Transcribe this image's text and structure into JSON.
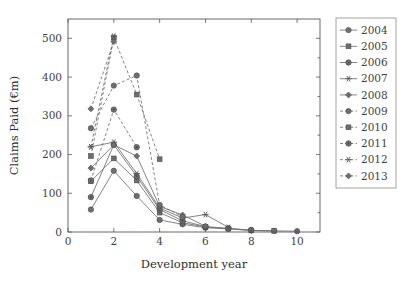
{
  "chart_data": {
    "type": "line",
    "title": "",
    "xlabel": "Development year",
    "ylabel": "Claims Paid (€m)",
    "xlim": [
      0,
      11
    ],
    "ylim": [
      0,
      550
    ],
    "xticks": [
      0,
      2,
      4,
      6,
      8,
      10
    ],
    "yticks": [
      0,
      100,
      200,
      300,
      400,
      500
    ],
    "xticklabels": [
      "0",
      "2",
      "4",
      "6",
      "8",
      "10"
    ],
    "yticklabels": [
      "0",
      "100",
      "200",
      "300",
      "400",
      "500"
    ],
    "grid": false,
    "legend_position": "right-outside",
    "x": [
      1,
      2,
      3,
      4,
      5,
      6,
      7,
      8,
      9,
      10
    ],
    "series": [
      {
        "name": "2004",
        "marker": "circle",
        "dash": "solid",
        "color": "#6e6e6e",
        "x": [
          1,
          2,
          3,
          4,
          5,
          6,
          7,
          8,
          9,
          10
        ],
        "values": [
          58,
          158,
          93,
          31,
          20,
          11,
          8,
          4,
          3,
          2
        ]
      },
      {
        "name": "2005",
        "marker": "square",
        "dash": "solid",
        "color": "#6e6e6e",
        "x": [
          1,
          2,
          3,
          4,
          5,
          6,
          7,
          8,
          9
        ],
        "values": [
          131,
          190,
          133,
          50,
          24,
          13,
          9,
          4,
          3
        ]
      },
      {
        "name": "2006",
        "marker": "circle-filled",
        "dash": "solid",
        "color": "#6e6e6e",
        "x": [
          1,
          2,
          3,
          4,
          5,
          6,
          7,
          8
        ],
        "values": [
          90,
          225,
          144,
          58,
          29,
          14,
          9,
          5
        ]
      },
      {
        "name": "2007",
        "marker": "star",
        "dash": "solid",
        "color": "#6e6e6e",
        "x": [
          1,
          2,
          3,
          4,
          5,
          6,
          7
        ],
        "values": [
          220,
          232,
          151,
          62,
          36,
          45,
          12
        ]
      },
      {
        "name": "2008",
        "marker": "diamond",
        "dash": "solid",
        "color": "#6e6e6e",
        "x": [
          1,
          2,
          3,
          4,
          5,
          6
        ],
        "values": [
          165,
          225,
          196,
          66,
          44,
          15
        ]
      },
      {
        "name": "2009",
        "marker": "circle",
        "dash": "dashed",
        "color": "#6e6e6e",
        "x": [
          1,
          2,
          3,
          4,
          5
        ],
        "values": [
          268,
          378,
          404,
          70,
          39
        ]
      },
      {
        "name": "2010",
        "marker": "square",
        "dash": "dashed",
        "color": "#6e6e6e",
        "x": [
          1,
          2,
          3,
          4
        ],
        "values": [
          196,
          502,
          355,
          188
        ]
      },
      {
        "name": "2011",
        "marker": "circle-filled",
        "dash": "dashed",
        "color": "#6e6e6e",
        "x": [
          1,
          2,
          3
        ],
        "values": [
          133,
          316,
          219
        ]
      },
      {
        "name": "2012",
        "marker": "star",
        "dash": "dashed",
        "color": "#6e6e6e",
        "x": [
          1,
          2
        ],
        "values": [
          220,
          506
        ]
      },
      {
        "name": "2013",
        "marker": "diamond",
        "dash": "dashed",
        "color": "#6e6e6e",
        "x": [
          1,
          2
        ],
        "values": [
          318,
          492
        ]
      }
    ]
  },
  "legend": {
    "entries": [
      {
        "label": "2004"
      },
      {
        "label": "2005"
      },
      {
        "label": "2006"
      },
      {
        "label": "2007"
      },
      {
        "label": "2008"
      },
      {
        "label": "2009"
      },
      {
        "label": "2010"
      },
      {
        "label": "2011"
      },
      {
        "label": "2012"
      },
      {
        "label": "2013"
      }
    ]
  }
}
